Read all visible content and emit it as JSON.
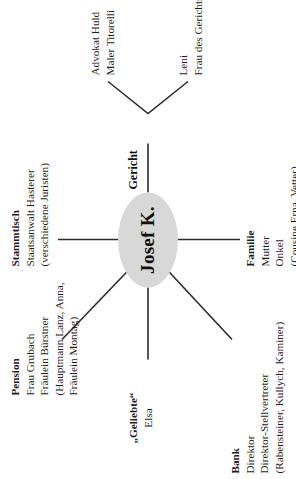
{
  "figure": {
    "hub": {
      "label": "Josef K."
    },
    "nodes": [
      {
        "id": "pension",
        "head": "Pension",
        "lines": [
          "Frau Grubach",
          "Fräulein Bürstner",
          "(Hauptmann Lanz, Anna,",
          "Fräulein Montag)"
        ]
      },
      {
        "id": "stammtisch",
        "head": "Stammtisch",
        "lines": [
          "Staatsanwalt Hasterer",
          "(verschiedene Juristen)"
        ]
      },
      {
        "id": "geliebte",
        "head": "„Geliebte“",
        "lines": [
          "Elsa"
        ]
      },
      {
        "id": "bank",
        "head": "Bank",
        "lines": [
          "Direktor",
          "Direktor-Stellvertreter",
          "(Rabensteiner, Kullych, Kaminer)"
        ]
      },
      {
        "id": "familie",
        "head": "Familie",
        "lines": [
          "Mutter",
          "Onkel",
          "(Cousine Erna, Vetter)"
        ]
      }
    ],
    "court": {
      "label": "Gericht",
      "branch_upper": [
        "Advokat Huld",
        "Maler Titorelli"
      ],
      "branch_lower": [
        "Leni",
        "Frau des Gerichtsdieners"
      ]
    },
    "edge_caption": "· · ·"
  },
  "style": {
    "hub_fill": "#d8d8d8",
    "line_color": "#2b2b2b",
    "text_color": "#1d1d1d"
  }
}
